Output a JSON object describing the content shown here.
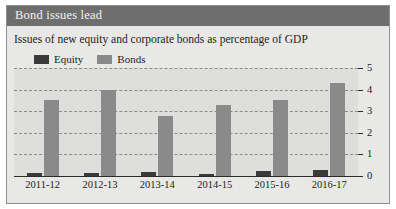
{
  "header": {
    "title": "Bond issues lead",
    "subtitle": "Issues of new equity and corporate bonds as percentage of GDP"
  },
  "colors": {
    "title_bar": "#6e6e6e",
    "equity": "#3a3a3a",
    "bonds": "#8a8a8a",
    "plot_background": "#dededc",
    "frame_background": "#e8e8e6",
    "gridline": "#8c8c8c",
    "axis": "#2b2b2b"
  },
  "legend": {
    "items": [
      {
        "label": "Equity",
        "color": "#3a3a3a"
      },
      {
        "label": "Bonds",
        "color": "#8a8a8a"
      }
    ]
  },
  "chart_data": {
    "type": "bar",
    "title": "Bond issues lead",
    "subtitle": "Issues of new equity and corporate bonds as percentage of GDP",
    "xlabel": "",
    "ylabel": "",
    "categories": [
      "2011-12",
      "2012-13",
      "2013-14",
      "2014-15",
      "2015-16",
      "2016-17"
    ],
    "series": [
      {
        "name": "Equity",
        "color": "#3a3a3a",
        "values": [
          0.15,
          0.12,
          0.18,
          0.1,
          0.25,
          0.28
        ]
      },
      {
        "name": "Bonds",
        "color": "#8a8a8a",
        "values": [
          3.5,
          4.0,
          2.8,
          3.3,
          3.5,
          4.3
        ]
      }
    ],
    "ylim": [
      0,
      5
    ],
    "yticks": [
      0,
      1,
      2,
      3,
      4,
      5
    ],
    "ytick_labels": [
      "0",
      "1",
      "2",
      "3",
      "4",
      "5"
    ],
    "grid": true,
    "grid_style": "dashed",
    "legend_position": "top-left"
  }
}
